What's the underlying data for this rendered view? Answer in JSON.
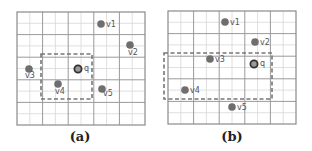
{
  "colors": {
    "grid_major": "#9a9a9a",
    "grid_minor": "#d8d8d8",
    "border": "#8a8a8a",
    "point": "#6e6e6e",
    "query_ring": "#333333",
    "dashed_box": "#777777",
    "label": "#555555"
  },
  "panels": [
    {
      "id": "a",
      "caption": "(a)",
      "points": [
        {
          "label": "v1",
          "x": 101,
          "y": 24
        },
        {
          "label": "v2",
          "x": 130,
          "y": 45
        },
        {
          "label": "v3",
          "x": 29,
          "y": 69
        },
        {
          "label": "v4",
          "x": 58,
          "y": 84
        },
        {
          "label": "v5",
          "x": 102,
          "y": 89
        }
      ],
      "query": {
        "label": "q",
        "x": 78,
        "y": 69
      },
      "box": {
        "x": 41,
        "y": 54,
        "w": 51,
        "h": 45
      }
    },
    {
      "id": "b",
      "caption": "(b)",
      "points": [
        {
          "label": "v1",
          "x": 225,
          "y": 22
        },
        {
          "label": "v2",
          "x": 255,
          "y": 42
        },
        {
          "label": "v3",
          "x": 210,
          "y": 59
        },
        {
          "label": "v4",
          "x": 185,
          "y": 90
        },
        {
          "label": "v5",
          "x": 232,
          "y": 107
        }
      ],
      "query": {
        "label": "q",
        "x": 254,
        "y": 64
      },
      "box": {
        "x": 164,
        "y": 53,
        "w": 108,
        "h": 46
      }
    }
  ]
}
